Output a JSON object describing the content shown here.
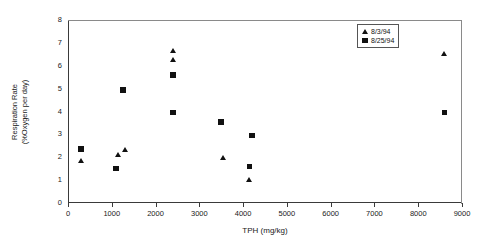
{
  "chart_data": {
    "type": "scatter",
    "title": "",
    "xlabel": "TPH (mg/kg)",
    "ylabel_line1": "Respiration Rate",
    "ylabel_line2": "(%Oxygen per day)",
    "xlim": [
      0,
      9000
    ],
    "ylim": [
      0,
      8
    ],
    "xticks": [
      0,
      1000,
      2000,
      3000,
      4000,
      5000,
      6000,
      7000,
      8000,
      9000
    ],
    "xticklabels": [
      "0",
      "1000",
      "2000",
      "3000",
      "4000",
      "5000",
      "6000",
      "7000",
      "8000",
      "9000"
    ],
    "yticks": [
      0,
      1,
      2,
      3,
      4,
      5,
      6,
      7,
      8
    ],
    "yticklabels": [
      "0",
      "1",
      "2",
      "3",
      "4",
      "5",
      "6",
      "7",
      "8"
    ],
    "grid": false,
    "legend_position": "top-right",
    "marker_color": "#111111",
    "series": [
      {
        "name": "8/3/94",
        "marker": "triangle",
        "points": [
          {
            "x": 300,
            "y": 1.85
          },
          {
            "x": 1150,
            "y": 2.1
          },
          {
            "x": 1300,
            "y": 2.3
          },
          {
            "x": 2400,
            "y": 6.65
          },
          {
            "x": 2400,
            "y": 6.25
          },
          {
            "x": 3550,
            "y": 1.95
          },
          {
            "x": 4150,
            "y": 1.0
          },
          {
            "x": 8600,
            "y": 6.5
          }
        ]
      },
      {
        "name": "8/25/94",
        "marker": "square",
        "points": [
          {
            "x": 300,
            "y": 2.35
          },
          {
            "x": 1100,
            "y": 1.5
          },
          {
            "x": 1250,
            "y": 4.95
          },
          {
            "x": 2400,
            "y": 5.6
          },
          {
            "x": 2400,
            "y": 3.95
          },
          {
            "x": 3500,
            "y": 3.55
          },
          {
            "x": 4200,
            "y": 2.95
          },
          {
            "x": 4150,
            "y": 1.6
          },
          {
            "x": 8600,
            "y": 3.95
          }
        ]
      }
    ]
  },
  "legend": {
    "items": [
      {
        "label": "8/3/94",
        "marker": "triangle"
      },
      {
        "label": "8/25/94",
        "marker": "square"
      }
    ]
  }
}
